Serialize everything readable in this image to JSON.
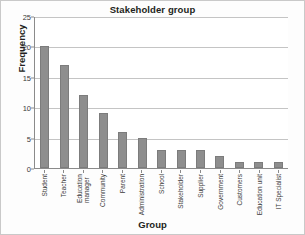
{
  "chart_data": {
    "type": "bar",
    "title": "Stakeholder group",
    "xlabel": "Group",
    "ylabel": "Frequency",
    "ylim": [
      0,
      25
    ],
    "yticks": [
      0,
      5,
      10,
      15,
      20,
      25
    ],
    "grid": "horizontal",
    "legend": "none",
    "bar_color": "#8e8e8e",
    "categories": [
      "Student",
      "Education manager",
      "Teacher",
      "Community",
      "Parent",
      "Administration",
      "School",
      "Stakeholder",
      "Supplier",
      "Government",
      "Customers",
      "Education unit",
      "IT Specialist"
    ],
    "bars": [
      {
        "label": "Student",
        "line1": "Student",
        "line2": "",
        "value": 20
      },
      {
        "label": "Teacher",
        "line1": "Teacher",
        "line2": "",
        "value": 17
      },
      {
        "label": "Education manager",
        "line1": "Education",
        "line2": "manager",
        "value": 12
      },
      {
        "label": "Community",
        "line1": "Community",
        "line2": "",
        "value": 9
      },
      {
        "label": "Parent",
        "line1": "Parent",
        "line2": "",
        "value": 6
      },
      {
        "label": "Administration",
        "line1": "Administration",
        "line2": "",
        "value": 5
      },
      {
        "label": "School",
        "line1": "School",
        "line2": "",
        "value": 3
      },
      {
        "label": "Stakeholder",
        "line1": "Stakeholder",
        "line2": "",
        "value": 3
      },
      {
        "label": "Supplier",
        "line1": "Supplier",
        "line2": "",
        "value": 3
      },
      {
        "label": "Government",
        "line1": "Government",
        "line2": "",
        "value": 2
      },
      {
        "label": "Customers",
        "line1": "Customers",
        "line2": "",
        "value": 1
      },
      {
        "label": "Education unit",
        "line1": "Education unit",
        "line2": "",
        "value": 1
      },
      {
        "label": "IT Specialist",
        "line1": "IT Specialist",
        "line2": "",
        "value": 1
      }
    ],
    "values": [
      20,
      17,
      12,
      9,
      6,
      5,
      3,
      3,
      3,
      2,
      1,
      1,
      1
    ]
  }
}
